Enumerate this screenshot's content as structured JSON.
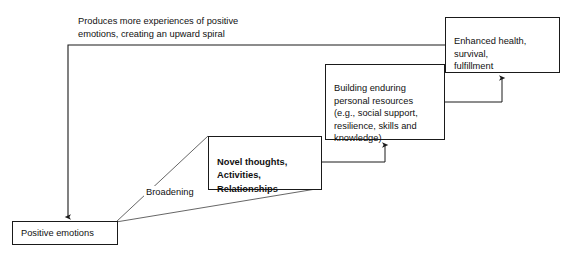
{
  "diagram": {
    "type": "flow-diagram",
    "background_color": "#ffffff",
    "line_color": "#1a1a1a",
    "text_color": "#111111",
    "nodes": [
      {
        "id": "positive-emotions",
        "label": "Positive emotions",
        "bold": false,
        "x": 12,
        "y": 221,
        "width": 106,
        "height": 24
      },
      {
        "id": "novel-thoughts",
        "label": "Novel thoughts,\nActivities,\nRelationships",
        "bold": true,
        "x": 208,
        "y": 136,
        "width": 114,
        "height": 54
      },
      {
        "id": "building-resources",
        "label": "Building enduring\npersonal resources\n(e.g., social support,\nresilience, skills and\nknowledge)",
        "bold": false,
        "x": 325,
        "y": 64,
        "width": 120,
        "height": 76
      },
      {
        "id": "enhanced-health",
        "label": "Enhanced health,\nsurvival,\nfulfillment",
        "bold": false,
        "x": 445,
        "y": 17,
        "width": 115,
        "height": 56
      }
    ],
    "labels": [
      {
        "id": "spiral-label",
        "text": "Produces more experiences of positive\nemotions, creating an upward spiral",
        "x": 78,
        "y": 15
      },
      {
        "id": "broadening-label",
        "text": "Broadening",
        "x": 144,
        "y": 186
      }
    ],
    "edges": [
      {
        "id": "broaden-upper",
        "from": "positive-emotions",
        "to": "novel-thoughts",
        "style": "plain-line"
      },
      {
        "id": "broaden-lower",
        "from": "positive-emotions",
        "to": "novel-thoughts",
        "style": "plain-line"
      },
      {
        "id": "novel-to-building",
        "from": "novel-thoughts",
        "to": "building-resources",
        "style": "elbow-arrow"
      },
      {
        "id": "building-to-health",
        "from": "building-resources",
        "to": "enhanced-health",
        "style": "elbow-arrow"
      },
      {
        "id": "health-to-positive-spiral",
        "from": "enhanced-health",
        "to": "positive-emotions",
        "style": "elbow-arrow"
      }
    ]
  }
}
